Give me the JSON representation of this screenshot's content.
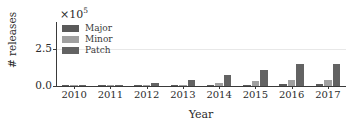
{
  "chart_data": {
    "type": "bar",
    "title": "",
    "xlabel": "Year",
    "ylabel": "# releases",
    "exponent_label": "×10",
    "exponent_power": "5",
    "categories": [
      "2010",
      "2011",
      "2012",
      "2013",
      "2014",
      "2015",
      "2016",
      "2017"
    ],
    "series": [
      {
        "name": "Major",
        "color": "#5a5a5a",
        "values": [
          200,
          700,
          1500,
          4000,
          3500,
          10000,
          14000,
          13000
        ]
      },
      {
        "name": "Minor",
        "color": "#a0a0a0",
        "values": [
          300,
          900,
          2000,
          6000,
          18000,
          33000,
          43000,
          38000
        ]
      },
      {
        "name": "Patch",
        "color": "#636363",
        "values": [
          500,
          4000,
          17000,
          38000,
          72000,
          110000,
          145000,
          148000
        ]
      }
    ],
    "yticks": [
      {
        "label": "0.0",
        "value": 0
      },
      {
        "label": "2.5",
        "value": 250000
      }
    ],
    "ylim": [
      0,
      430000
    ],
    "xlim_note": "categorical",
    "grid": true,
    "legend_position": "upper left",
    "legend_entries": [
      "Major",
      "Minor",
      "Patch"
    ],
    "axis_color": "#3a3a3a",
    "grid_color": "#e8e8e8",
    "background": "#ffffff"
  }
}
